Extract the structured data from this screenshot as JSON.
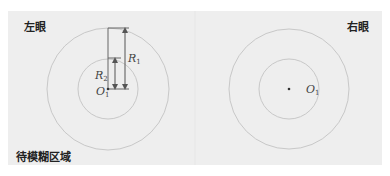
{
  "labels": {
    "left_eye": "左眼",
    "right_eye": "右眼",
    "blur_region": "待模糊区域"
  },
  "left_diagram": {
    "center_label": "O",
    "center_sub": "1",
    "outer_radius_label": "R",
    "outer_radius_sub": "1",
    "inner_radius_label": "R",
    "inner_radius_sub": "2"
  },
  "right_diagram": {
    "center_label": "O",
    "center_sub": "1"
  },
  "colors": {
    "panel": "#eeeeee",
    "circle": "#c8c8c8",
    "line": "#555555"
  }
}
